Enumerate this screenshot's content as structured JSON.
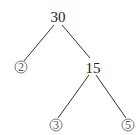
{
  "diagram": {
    "type": "factor-tree",
    "root": {
      "label": "30"
    },
    "nodes": [
      {
        "id": "n30",
        "label": "30",
        "x": 58,
        "y": 22,
        "circled": false
      },
      {
        "id": "n2",
        "label": "2",
        "x": 21,
        "y": 68,
        "circled": true
      },
      {
        "id": "n15",
        "label": "15",
        "x": 93,
        "y": 68,
        "circled": false
      },
      {
        "id": "n3",
        "label": "3",
        "x": 56,
        "y": 125,
        "circled": true
      },
      {
        "id": "n5",
        "label": "5",
        "x": 128,
        "y": 125,
        "circled": true
      }
    ],
    "edges": [
      {
        "from": "30",
        "to": "2"
      },
      {
        "from": "30",
        "to": "15"
      },
      {
        "from": "15",
        "to": "3"
      },
      {
        "from": "15",
        "to": "5"
      }
    ]
  }
}
